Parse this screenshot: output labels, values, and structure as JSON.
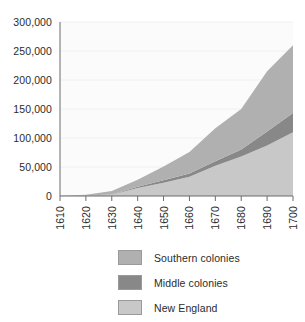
{
  "chart_data": {
    "type": "area",
    "stacked": true,
    "title": "",
    "subtitle": "",
    "xlabel": "",
    "ylabel": "",
    "x": [
      1610,
      1620,
      1630,
      1640,
      1650,
      1660,
      1670,
      1680,
      1690,
      1700
    ],
    "categories": [
      "1610",
      "1620",
      "1630",
      "1640",
      "1650",
      "1660",
      "1670",
      "1680",
      "1690",
      "1700"
    ],
    "series": [
      {
        "name": "New England",
        "color": "#c8c8c8",
        "stack_order": 1,
        "values": [
          0,
          500,
          2000,
          14000,
          23000,
          33000,
          52000,
          68000,
          87000,
          110000
        ]
      },
      {
        "name": "Middle colonies",
        "color": "#888888",
        "stack_order": 2,
        "values": [
          0,
          300,
          500,
          2000,
          4000,
          6000,
          8000,
          12000,
          24000,
          33000
        ]
      },
      {
        "name": "Southern colonies",
        "color": "#b0b0b0",
        "stack_order": 3,
        "values": [
          400,
          1500,
          6000,
          12000,
          24000,
          37000,
          57000,
          70000,
          104000,
          117000
        ]
      }
    ],
    "cumulative_totals": [
      400,
      2300,
      8500,
      28000,
      51000,
      76000,
      117000,
      150000,
      215000,
      260000
    ],
    "ylim": [
      0,
      300000
    ],
    "xlim": [
      1610,
      1700
    ],
    "yticks": [
      0,
      50000,
      100000,
      150000,
      200000,
      250000,
      300000
    ],
    "ytick_labels": [
      "0",
      "50,000",
      "100,000",
      "150,000",
      "200,000",
      "250,000",
      "300,000"
    ],
    "xtick_labels": [
      "1610",
      "1620",
      "1630",
      "1640",
      "1650",
      "1660",
      "1670",
      "1680",
      "1690",
      "1700"
    ],
    "xtick_rotation": 90,
    "grid": "horizontal-faint",
    "legend_position": "below",
    "plot_background": "#fbfbfb"
  },
  "legend": {
    "items": [
      {
        "label": "Southern colonies",
        "color": "#b0b0b0"
      },
      {
        "label": "Middle colonies",
        "color": "#888888"
      },
      {
        "label": "New England",
        "color": "#c8c8c8"
      }
    ]
  },
  "axis": {
    "line_color": "#6b6b6b"
  }
}
